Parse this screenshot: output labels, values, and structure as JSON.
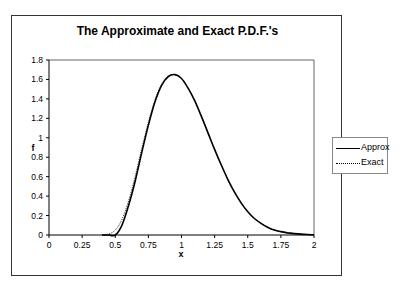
{
  "chart_data": {
    "type": "line",
    "title": "The Approximate and Exact P.D.F.'s",
    "xlabel": "x",
    "ylabel": "f",
    "xlim": [
      0,
      2
    ],
    "ylim": [
      0,
      1.8
    ],
    "x_ticks": [
      "0",
      "0.25",
      "0.5",
      "0.75",
      "1",
      "1.25",
      "1.5",
      "1.75",
      "2"
    ],
    "y_ticks": [
      "0",
      "0.2",
      "0.4",
      "0.6",
      "0.8",
      "1",
      "1.2",
      "1.4",
      "1.6",
      "1.8"
    ],
    "grid": false,
    "legend_position": "right",
    "x": [
      0.4,
      0.45,
      0.5,
      0.55,
      0.6,
      0.65,
      0.7,
      0.75,
      0.8,
      0.85,
      0.9,
      0.95,
      1.0,
      1.05,
      1.1,
      1.15,
      1.2,
      1.25,
      1.3,
      1.35,
      1.4,
      1.45,
      1.5,
      1.55,
      1.6,
      1.65,
      1.7,
      1.75,
      1.8,
      1.85,
      1.9,
      1.95,
      2.0
    ],
    "series": [
      {
        "name": "Approx",
        "style": "solid",
        "values": [
          0.0,
          0.0,
          0.0,
          0.1,
          0.3,
          0.55,
          0.85,
          1.13,
          1.37,
          1.54,
          1.63,
          1.65,
          1.61,
          1.51,
          1.38,
          1.22,
          1.05,
          0.88,
          0.72,
          0.57,
          0.44,
          0.33,
          0.24,
          0.17,
          0.12,
          0.08,
          0.05,
          0.035,
          0.022,
          0.014,
          0.009,
          0.005,
          0.003
        ]
      },
      {
        "name": "Exact",
        "style": "dotted",
        "values": [
          0.0,
          0.01,
          0.05,
          0.16,
          0.35,
          0.6,
          0.89,
          1.16,
          1.39,
          1.55,
          1.63,
          1.65,
          1.61,
          1.51,
          1.38,
          1.22,
          1.05,
          0.88,
          0.72,
          0.57,
          0.44,
          0.33,
          0.24,
          0.17,
          0.12,
          0.08,
          0.05,
          0.035,
          0.022,
          0.014,
          0.009,
          0.005,
          0.003
        ]
      }
    ]
  },
  "legend": {
    "items": [
      {
        "label": "Approx"
      },
      {
        "label": "Exact"
      }
    ]
  },
  "colors": {
    "line": "#000000",
    "frame": "#333333"
  }
}
